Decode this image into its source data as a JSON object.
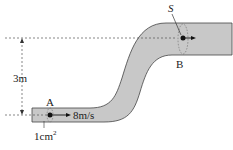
{
  "diagram": {
    "labels": {
      "height": "3m",
      "point_a": "A",
      "point_b": "B",
      "speed": "8m/s",
      "area": "1cm",
      "area_exp": "2",
      "area_b": "S"
    },
    "colors": {
      "pipe_fill": "#c8c8c8",
      "line": "#333333"
    }
  }
}
